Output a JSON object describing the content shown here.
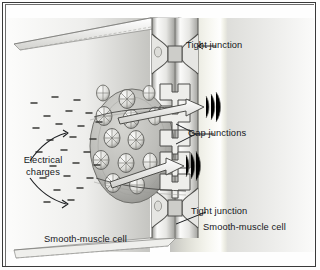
{
  "figure": {
    "kind": "cell-junction-illustration",
    "style": "grayscale airbrush anatomical drawing"
  },
  "labels": {
    "tight_junction_top": "Tight junction",
    "gap_junctions": "Gap junctions",
    "tight_junction_bottom": "Tight junction",
    "smooth_muscle_cell_right": "Smooth-muscle cell",
    "smooth_muscle_cell_left": "Smooth-muscle cell",
    "electrical_charges_line1": "Electrical",
    "electrical_charges_line2": "charges"
  },
  "colors": {
    "ink": "#16181c",
    "frame": "#3a3a3a",
    "membrane_light": "#f2f2f0",
    "membrane_mid": "#c9c9c6",
    "membrane_dark": "#8d8d8a",
    "plaque_fill": "#b8b8b4",
    "cell_field": "#e2e2df",
    "background": "#fefefe"
  },
  "structures": {
    "plaque_label": "gap-junction plaque",
    "connexon_count": 13,
    "channel_count": 5,
    "charge_dash_count": 26
  }
}
